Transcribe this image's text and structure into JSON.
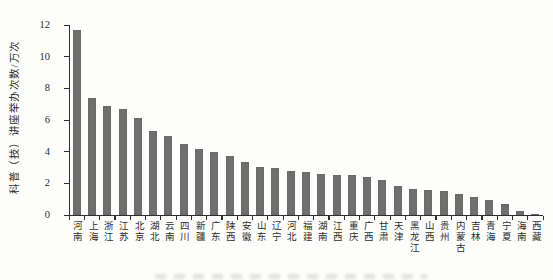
{
  "figure": {
    "background": "#fdfdfb",
    "axis_color": "#2f2f2f",
    "text_color": "#2e2e2e"
  },
  "chart_data": {
    "type": "bar",
    "title": "",
    "xlabel": "",
    "ylabel": "科普（技）讲座举办次数/万次",
    "ylim": [
      0,
      12
    ],
    "yticks": [
      0,
      2,
      4,
      6,
      8,
      10,
      12
    ],
    "grid": false,
    "legend_position": "none",
    "bar_color": "#6f6f6f",
    "categories": [
      "河南",
      "上海",
      "浙江",
      "江苏",
      "北京",
      "湖北",
      "云南",
      "四川",
      "新疆",
      "广东",
      "陕西",
      "安徽",
      "山东",
      "辽宁",
      "河北",
      "福建",
      "湖南",
      "江西",
      "重庆",
      "广西",
      "甘肃",
      "天津",
      "黑龙江",
      "山西",
      "贵州",
      "内蒙古",
      "吉林",
      "青海",
      "宁夏",
      "海南",
      "西藏"
    ],
    "values": [
      11.7,
      7.4,
      6.9,
      6.7,
      6.1,
      5.3,
      5.0,
      4.5,
      4.2,
      4.0,
      3.7,
      3.35,
      3.05,
      3.0,
      2.8,
      2.7,
      2.6,
      2.55,
      2.5,
      2.4,
      2.2,
      1.85,
      1.65,
      1.6,
      1.5,
      1.35,
      1.15,
      0.95,
      0.7,
      0.25,
      0.05
    ]
  }
}
